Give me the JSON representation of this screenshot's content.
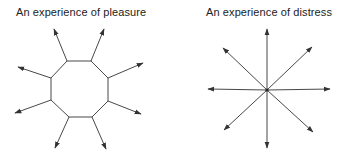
{
  "figures": [
    {
      "id": "pleasure",
      "title": "An experience of pleasure",
      "shape": "octagon-with-outward-arrows",
      "stroke_color": "#333333",
      "octagon": [
        [
          67,
          61
        ],
        [
          91,
          61
        ],
        [
          108,
          78
        ],
        [
          108,
          101
        ],
        [
          92,
          117
        ],
        [
          69,
          117
        ],
        [
          51,
          100
        ],
        [
          51,
          78
        ]
      ],
      "arrows": [
        {
          "from": [
            67,
            61
          ],
          "to": [
            54,
            29
          ]
        },
        {
          "from": [
            91,
            61
          ],
          "to": [
            104,
            29
          ]
        },
        {
          "from": [
            108,
            78
          ],
          "to": [
            143,
            63
          ]
        },
        {
          "from": [
            108,
            101
          ],
          "to": [
            141,
            114
          ]
        },
        {
          "from": [
            92,
            117
          ],
          "to": [
            106,
            149
          ]
        },
        {
          "from": [
            69,
            117
          ],
          "to": [
            55,
            148
          ]
        },
        {
          "from": [
            51,
            100
          ],
          "to": [
            15,
            113
          ]
        },
        {
          "from": [
            51,
            78
          ],
          "to": [
            18,
            67
          ]
        }
      ]
    },
    {
      "id": "distress",
      "title": "An experience of distress",
      "shape": "star-of-arrows-from-center",
      "stroke_color": "#333333",
      "center": [
        267,
        90
      ],
      "arrows": [
        {
          "from": [
            267,
            90
          ],
          "to": [
            267,
            29
          ]
        },
        {
          "from": [
            267,
            90
          ],
          "to": [
            267,
            148
          ]
        },
        {
          "from": [
            267,
            90
          ],
          "to": [
            208,
            89
          ]
        },
        {
          "from": [
            267,
            90
          ],
          "to": [
            330,
            89
          ]
        },
        {
          "from": [
            267,
            90
          ],
          "to": [
            223,
            48
          ]
        },
        {
          "from": [
            267,
            90
          ],
          "to": [
            312,
            47
          ]
        },
        {
          "from": [
            267,
            90
          ],
          "to": [
            224,
            130
          ]
        },
        {
          "from": [
            267,
            90
          ],
          "to": [
            313,
            132
          ]
        }
      ]
    }
  ]
}
